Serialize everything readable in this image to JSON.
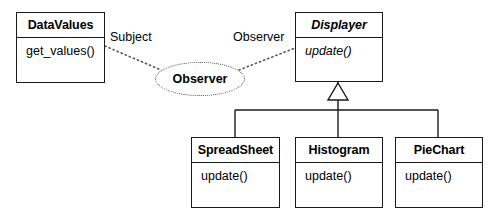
{
  "diagram": {
    "type": "uml-class-diagram",
    "pattern_name": "Observer",
    "classes": [
      {
        "id": "datavalues",
        "name": "DataValues",
        "abstract": false,
        "members": [
          "get_values()"
        ],
        "x": 16,
        "y": 12,
        "w": 89,
        "h": 71
      },
      {
        "id": "displayer",
        "name": "Displayer",
        "abstract": true,
        "members": [
          "update()"
        ],
        "x": 295,
        "y": 12,
        "w": 88,
        "h": 70
      },
      {
        "id": "spreadsheet",
        "name": "SpreadSheet",
        "abstract": false,
        "members": [
          "update()"
        ],
        "x": 191,
        "y": 137,
        "w": 89,
        "h": 71
      },
      {
        "id": "histogram",
        "name": "Histogram",
        "abstract": false,
        "members": [
          "update()"
        ],
        "x": 295,
        "y": 137,
        "w": 88,
        "h": 71
      },
      {
        "id": "piechart",
        "name": "PieChart",
        "abstract": false,
        "members": [
          "update()"
        ],
        "x": 395,
        "y": 137,
        "w": 88,
        "h": 71
      }
    ],
    "collaboration": {
      "label": "Observer",
      "cx": 200,
      "cy": 79,
      "rx": 45,
      "ry": 17
    },
    "role_labels": [
      {
        "id": "subject-role",
        "text": "Subject",
        "x": 110,
        "y": 30
      },
      {
        "id": "observer-role",
        "text": "Observer",
        "x": 233,
        "y": 30
      }
    ],
    "colors": {
      "stroke": "#1a1a1a",
      "dotted_stroke": "#555555",
      "background": "#ffffff",
      "text": "#000000"
    }
  }
}
